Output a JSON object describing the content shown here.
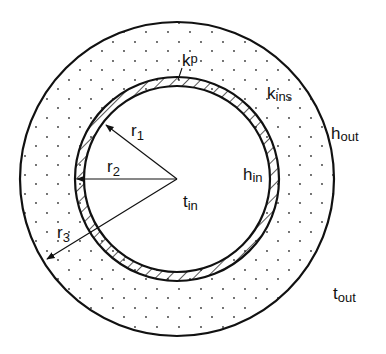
{
  "diagram": {
    "colors": {
      "stroke": "#111111",
      "background": "#ffffff",
      "dots": "#333333"
    },
    "labels": {
      "k_p": {
        "main": "k",
        "sub": "p"
      },
      "k_ins": {
        "main": "k",
        "sub": "ins"
      },
      "h_out": {
        "main": "h",
        "sub": "out"
      },
      "h_in": {
        "main": "h",
        "sub": "in"
      },
      "t_in": {
        "main": "t",
        "sub": "in"
      },
      "t_out": {
        "main": "t",
        "sub": "out"
      },
      "r1": {
        "main": "r",
        "sub": "1"
      },
      "r2": {
        "main": "r",
        "sub": "2"
      },
      "r3": {
        "main": "r",
        "sub": "3"
      }
    },
    "regions": [
      {
        "name": "fluid",
        "description": "inner fluid at t_in"
      },
      {
        "name": "pipe-wall",
        "description": "hatched pipe wall, conductivity k_p"
      },
      {
        "name": "insulation",
        "description": "dotted insulation layer, conductivity k_ins"
      }
    ]
  }
}
